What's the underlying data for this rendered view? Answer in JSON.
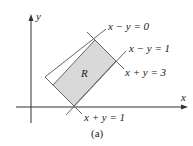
{
  "diagram": {
    "axes": {
      "x_label": "x",
      "y_label": "y"
    },
    "region_label": "R",
    "lines": [
      {
        "id": "x-minus-y-0",
        "label": "x − y = 0"
      },
      {
        "id": "x-minus-y-1",
        "label": "x − y = 1"
      },
      {
        "id": "x-plus-y-3",
        "label": "x + y = 3"
      },
      {
        "id": "x-plus-y-1",
        "label": "x + y = 1"
      }
    ],
    "caption": "(a)",
    "colors": {
      "region_fill": "#d9d9d9",
      "lines": "#555555",
      "axes": "#333333"
    }
  }
}
